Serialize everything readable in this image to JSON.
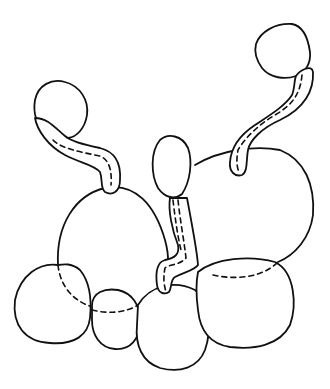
{
  "diagram": {
    "type": "line-drawing",
    "stroke_color": "#111111",
    "background": "#ffffff",
    "elements": [
      {
        "id": "small-blob-top-left",
        "kind": "blob"
      },
      {
        "id": "linker-left",
        "kind": "tube-linker"
      },
      {
        "id": "large-blob-center-left",
        "kind": "blob"
      },
      {
        "id": "small-blob-top-right",
        "kind": "blob"
      },
      {
        "id": "linker-right",
        "kind": "tube-linker"
      },
      {
        "id": "large-blob-right",
        "kind": "blob"
      },
      {
        "id": "small-blob-center",
        "kind": "blob"
      },
      {
        "id": "linker-center",
        "kind": "tube-linker"
      },
      {
        "id": "blob-bottom-left",
        "kind": "blob"
      },
      {
        "id": "blob-bottom-small",
        "kind": "blob"
      },
      {
        "id": "blob-bottom-center",
        "kind": "blob"
      },
      {
        "id": "blob-bottom-right",
        "kind": "blob"
      }
    ]
  }
}
